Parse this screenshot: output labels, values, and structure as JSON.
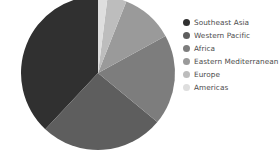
{
  "background_color": "#ffffff",
  "chart_data": {
    "type": "pie",
    "title": "",
    "subtitle": "",
    "xlabel": "",
    "ylabel": "",
    "grid": false,
    "legend_position": "right",
    "center": {
      "x": 98,
      "y": 73
    },
    "radius": 77,
    "start_angle_deg": 0,
    "direction": "clockwise",
    "categories": [
      "Southeast Asia",
      "Western Pacific",
      "Africa",
      "Eastern Mediterranean",
      "Europe",
      "Americas"
    ],
    "values": [
      38,
      26,
      19,
      11,
      4,
      2
    ],
    "units": "percent",
    "slices": [
      {
        "label": "Southeast Asia",
        "value": 38,
        "color": "#303030"
      },
      {
        "label": "Western Pacific",
        "value": 26,
        "color": "#5e5e5e"
      },
      {
        "label": "Africa",
        "value": 19,
        "color": "#7d7d7d"
      },
      {
        "label": "Eastern Mediterranean",
        "value": 11,
        "color": "#9a9a9a"
      },
      {
        "label": "Europe",
        "value": 4,
        "color": "#bdbdbd"
      },
      {
        "label": "Americas",
        "value": 2,
        "color": "#dedede"
      }
    ]
  },
  "legend": {
    "items": [
      {
        "label": "Southeast Asia",
        "color": "#303030",
        "marker": "circle-marker"
      },
      {
        "label": "Western Pacific",
        "color": "#5e5e5e",
        "marker": "circle-marker"
      },
      {
        "label": "Africa",
        "color": "#7d7d7d",
        "marker": "circle-marker"
      },
      {
        "label": "Eastern Mediterranean",
        "color": "#9a9a9a",
        "marker": "circle-marker"
      },
      {
        "label": "Europe",
        "color": "#bdbdbd",
        "marker": "circle-marker"
      },
      {
        "label": "Americas",
        "color": "#dedede",
        "marker": "circle-marker"
      }
    ]
  }
}
